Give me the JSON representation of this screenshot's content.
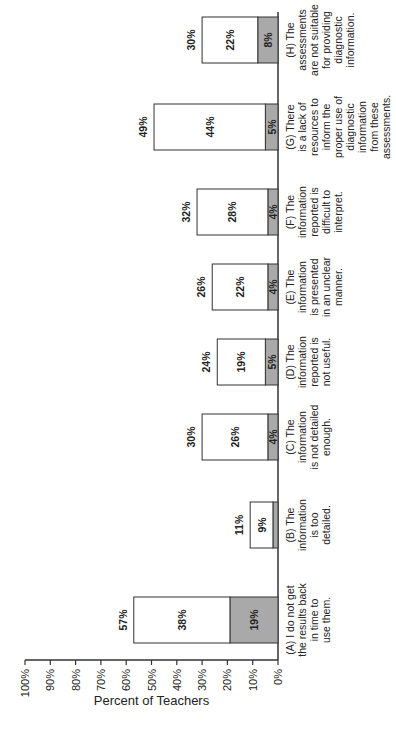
{
  "chart_data": {
    "type": "bar",
    "stacked": true,
    "orientation": "vertical, figure rotated 90 degrees",
    "title": "",
    "xlabel": "",
    "ylabel": "Percent of Teachers",
    "ylim": [
      0,
      100
    ],
    "yticks": [
      "0%",
      "10%",
      "20%",
      "30%",
      "40%",
      "50%",
      "60%",
      "70%",
      "80%",
      "90%",
      "100%"
    ],
    "grid": false,
    "legend": null,
    "categories": [
      [
        "(A) I do not get",
        "the results back",
        "in time to",
        "use them."
      ],
      [
        "(B) The",
        "information",
        "is too",
        "detailed."
      ],
      [
        "(C) The",
        "information",
        "is not detailed",
        "enough."
      ],
      [
        "(D) The",
        "information",
        "reported is",
        "not useful."
      ],
      [
        "(E) The",
        "information",
        "is presented",
        "in an unclear",
        "manner."
      ],
      [
        "(F) The",
        "information",
        "reported is",
        "difficult to",
        "interpret."
      ],
      [
        "(G) There",
        "is a lack of",
        "resources to",
        "inform the",
        "proper use of",
        "diagnostic",
        "information",
        "from these",
        "assessments."
      ],
      [
        "(H) The",
        "assessments",
        "are not suitable",
        "for providing",
        "diagnostic",
        "information."
      ]
    ],
    "series": [
      {
        "name": "grey segment",
        "color": "#a9a9a9",
        "values": [
          19,
          2,
          4,
          5,
          4,
          4,
          5,
          8
        ],
        "labels": [
          "19%",
          "",
          "4%",
          "5%",
          "4%",
          "4%",
          "5%",
          "8%"
        ]
      },
      {
        "name": "white segment",
        "color": "#ffffff",
        "values": [
          38,
          9,
          26,
          19,
          22,
          28,
          44,
          22
        ],
        "labels": [
          "38%",
          "9%",
          "26%",
          "19%",
          "22%",
          "28%",
          "44%",
          "22%"
        ]
      }
    ],
    "totals": [
      57,
      11,
      30,
      24,
      26,
      32,
      49,
      30
    ],
    "total_labels": [
      "57%",
      "11%",
      "30%",
      "24%",
      "26%",
      "32%",
      "49%",
      "30%"
    ]
  }
}
